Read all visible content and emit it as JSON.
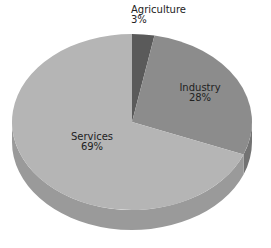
{
  "chart_data": {
    "type": "pie",
    "title": "",
    "style": "3d",
    "categories": [
      "Agriculture",
      "Industry",
      "Services"
    ],
    "values": [
      3,
      28,
      69
    ],
    "labels": [
      "3%",
      "28%",
      "69%"
    ],
    "colors": [
      "#5a5a5a",
      "#8c8c8c",
      "#b5b5b5"
    ],
    "side_colors": [
      "#444444",
      "#737373",
      "#9a9a9a"
    ],
    "legend": "none",
    "start_angle_deg": 0,
    "direction": "clockwise"
  },
  "slices": [
    {
      "name": "Agriculture",
      "pct": "3%"
    },
    {
      "name": "Industry",
      "pct": "28%"
    },
    {
      "name": "Services",
      "pct": "69%"
    }
  ]
}
